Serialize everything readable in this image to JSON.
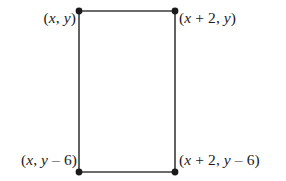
{
  "figure": {
    "type": "geometry-diagram",
    "shape": "rectangle",
    "background_color": "#ffffff",
    "stroke_color": "#3a3a3a",
    "vertex_color": "#1a1a1a",
    "text_color": "#1b1b1b",
    "rectangle": {
      "left_x": 79,
      "right_x": 175,
      "top_y": 11,
      "bottom_y": 172,
      "width": 96,
      "height": 161
    },
    "vertices": [
      {
        "id": "top-left",
        "label": "(x, y)",
        "parts": [
          {
            "text": "(",
            "kind": "paren"
          },
          {
            "text": "x",
            "kind": "v"
          },
          {
            "text": ", ",
            "kind": "comma"
          },
          {
            "text": "y",
            "kind": "v"
          },
          {
            "text": ")",
            "kind": "paren"
          }
        ],
        "cx": 79,
        "cy": 11
      },
      {
        "id": "top-right",
        "label": "(x + 2, y)",
        "parts": [
          {
            "text": "(",
            "kind": "paren"
          },
          {
            "text": "x",
            "kind": "v"
          },
          {
            "text": " + ",
            "kind": "op"
          },
          {
            "text": "2",
            "kind": "num"
          },
          {
            "text": ", ",
            "kind": "comma"
          },
          {
            "text": "y",
            "kind": "v"
          },
          {
            "text": ")",
            "kind": "paren"
          }
        ],
        "cx": 175,
        "cy": 11
      },
      {
        "id": "bottom-left",
        "label": "(x, y − 6)",
        "parts": [
          {
            "text": "(",
            "kind": "paren"
          },
          {
            "text": "x",
            "kind": "v"
          },
          {
            "text": ", ",
            "kind": "comma"
          },
          {
            "text": "y",
            "kind": "v"
          },
          {
            "text": " – ",
            "kind": "op"
          },
          {
            "text": "6",
            "kind": "num"
          },
          {
            "text": ")",
            "kind": "paren"
          }
        ],
        "cx": 79,
        "cy": 172
      },
      {
        "id": "bottom-right",
        "label": "(x + 2, y − 6)",
        "parts": [
          {
            "text": "(",
            "kind": "paren"
          },
          {
            "text": "x",
            "kind": "v"
          },
          {
            "text": " + ",
            "kind": "op"
          },
          {
            "text": "2",
            "kind": "num"
          },
          {
            "text": ", ",
            "kind": "comma"
          },
          {
            "text": "y",
            "kind": "v"
          },
          {
            "text": " – ",
            "kind": "op"
          },
          {
            "text": "6",
            "kind": "num"
          },
          {
            "text": ")",
            "kind": "paren"
          }
        ],
        "cx": 175,
        "cy": 172
      }
    ]
  }
}
